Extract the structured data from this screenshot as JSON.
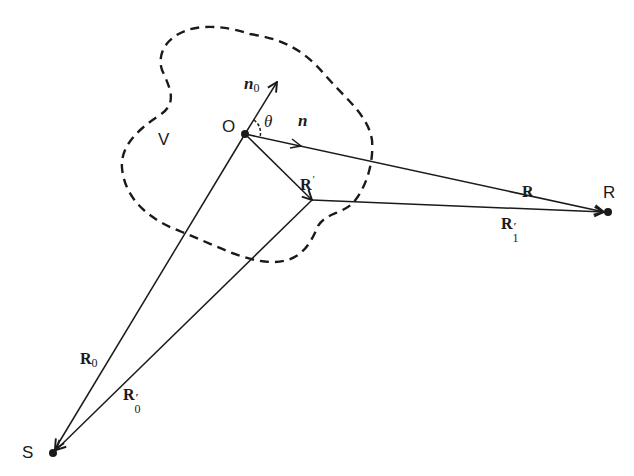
{
  "diagram": {
    "type": "geometric scattering geometry",
    "colors": {
      "stroke": "#1a1a1a",
      "background": "#ffffff"
    },
    "points": {
      "O": {
        "label": "O",
        "x": 245,
        "y": 134
      },
      "R_prime_point": {
        "x": 312,
        "y": 200
      },
      "R": {
        "label": "R",
        "x": 608,
        "y": 212
      },
      "S": {
        "label": "S",
        "x": 53,
        "y": 453
      }
    },
    "region": {
      "label": "V",
      "style": "dashed"
    },
    "vectors": {
      "n0": {
        "base": "n",
        "sub": "0"
      },
      "n": {
        "base": "n"
      },
      "theta": {
        "symbol": "θ"
      },
      "R_prime": {
        "base": "R",
        "prime": "′"
      },
      "R": {
        "base": "R"
      },
      "R1_prime": {
        "base": "R",
        "prime": "′",
        "sub": "1"
      },
      "R0": {
        "base": "R",
        "sub": "0"
      },
      "R0_prime": {
        "base": "R",
        "prime": "′",
        "sub": "0"
      }
    }
  }
}
